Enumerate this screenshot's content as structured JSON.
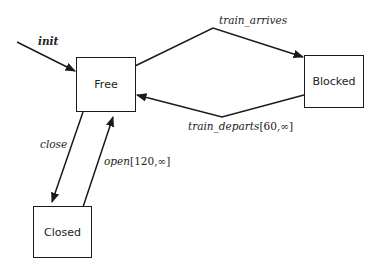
{
  "states": [
    {
      "id": "free",
      "label": "Free"
    },
    {
      "id": "blocked",
      "label": "Blocked"
    },
    {
      "id": "closed",
      "label": "Closed"
    }
  ],
  "transitions": [
    {
      "id": "init",
      "event": "init",
      "guard": "",
      "from": "",
      "to": "Free"
    },
    {
      "id": "train_arrives",
      "event": "train_arrives",
      "guard": "",
      "from": "Free",
      "to": "Blocked"
    },
    {
      "id": "train_departs",
      "event": "train_departs",
      "guard": "[60,∞]",
      "from": "Blocked",
      "to": "Free"
    },
    {
      "id": "close",
      "event": "close",
      "guard": "",
      "from": "Free",
      "to": "Closed"
    },
    {
      "id": "open",
      "event": "open",
      "guard": "[120,∞]",
      "from": "Closed",
      "to": "Free"
    }
  ],
  "colors": {
    "stroke": "#1a1a1a",
    "background": "#ffffff"
  }
}
